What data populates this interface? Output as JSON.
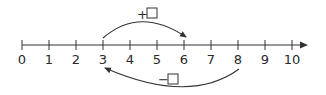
{
  "number_line": {
    "min": 0,
    "max": 10,
    "tick_labels": [
      "0",
      "1",
      "2",
      "3",
      "4",
      "5",
      "6",
      "7",
      "8",
      "9",
      "10"
    ],
    "line_color": "#333333"
  },
  "jumps": [
    {
      "name": "forward",
      "from": 3,
      "to": 6,
      "label_sign": "+",
      "label": "+□",
      "position": "above"
    },
    {
      "name": "backward",
      "from": 8,
      "to": 3,
      "label_sign": "−",
      "label": "−□",
      "position": "below"
    }
  ]
}
